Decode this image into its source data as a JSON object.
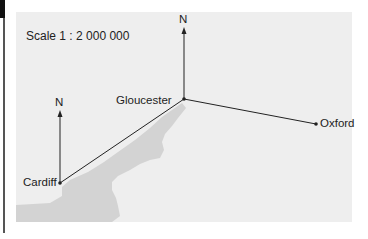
{
  "diagram": {
    "scale_label": "Scale 1 : 2 000 000",
    "north_label": "N",
    "colors": {
      "background": "#ffffff",
      "map_fill": "#eeeeee",
      "water_fill": "#d3d3d3",
      "line": "#222222"
    },
    "places": [
      {
        "name": "Gloucester",
        "x": 184,
        "y": 99
      },
      {
        "name": "Cardiff",
        "x": 60,
        "y": 183
      },
      {
        "name": "Oxford",
        "x": 316,
        "y": 124
      }
    ],
    "north_arrows": [
      {
        "at": "Gloucester"
      },
      {
        "at": "Cardiff"
      }
    ]
  }
}
